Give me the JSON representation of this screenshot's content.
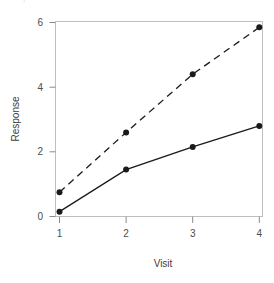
{
  "figure": {
    "clipped_top_text": "Sample size",
    "background_color": "#ffffff",
    "frame_color": "#bfbfbf",
    "tick_color": "#8c8c8c",
    "label_color": "#4d4d4d",
    "series_color": "#1a1a1a"
  },
  "chart_data": {
    "type": "line",
    "title": "",
    "xlabel": "Visit",
    "ylabel": "Response",
    "x": [
      1,
      2,
      3,
      4
    ],
    "xtick_labels": [
      "1",
      "2",
      "3",
      "4"
    ],
    "ytick_labels": [
      "0",
      "2",
      "4",
      "6"
    ],
    "yticks": [
      0,
      2,
      4,
      6
    ],
    "xlim": [
      0.7,
      4.3
    ],
    "ylim": [
      -0.35,
      6.2
    ],
    "grid": false,
    "legend": "none",
    "series": [
      {
        "name": "Treatment",
        "linestyle": "dashed",
        "marker": "filled-circle",
        "color": "#1a1a1a",
        "values": [
          0.75,
          2.6,
          4.4,
          5.85
        ]
      },
      {
        "name": "Control",
        "linestyle": "solid",
        "marker": "filled-circle",
        "color": "#1a1a1a",
        "values": [
          0.15,
          1.45,
          2.15,
          2.8
        ]
      }
    ]
  }
}
